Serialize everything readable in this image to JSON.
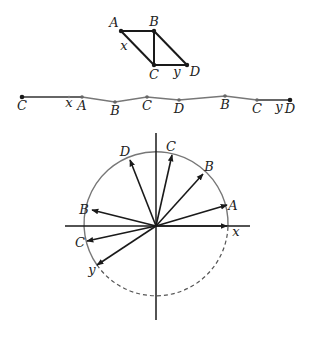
{
  "parallelogram": {
    "points": {
      "A": {
        "x": 121,
        "y": 31,
        "lx": 114,
        "ly": 27
      },
      "B": {
        "x": 154,
        "y": 31,
        "lx": 154,
        "ly": 26
      },
      "C": {
        "x": 154,
        "y": 65,
        "lx": 154,
        "ly": 79
      },
      "D": {
        "x": 187,
        "y": 65,
        "lx": 195,
        "ly": 76
      }
    },
    "labels": {
      "A": "A",
      "B": "B",
      "C": "C",
      "D": "D",
      "x": "x",
      "y": "y"
    },
    "x_label_pos": {
      "x": 124,
      "y": 50
    },
    "y_label_pos": {
      "x": 177,
      "y": 76
    }
  },
  "chain": {
    "points": [
      {
        "id": "C",
        "label": "C",
        "x": 22,
        "y": 97
      },
      {
        "id": "A",
        "label": "A",
        "x": 82,
        "y": 97
      },
      {
        "id": "B",
        "label": "B",
        "x": 115,
        "y": 102
      },
      {
        "id": "C2",
        "label": "C",
        "x": 147,
        "y": 97
      },
      {
        "id": "D",
        "label": "D",
        "x": 179,
        "y": 100
      },
      {
        "id": "B2",
        "label": "B",
        "x": 225,
        "y": 96
      },
      {
        "id": "C3",
        "label": "C",
        "x": 257,
        "y": 100
      },
      {
        "id": "D2",
        "label": "D",
        "x": 290,
        "y": 100
      }
    ],
    "x_label": "x",
    "y_label": "y",
    "x_label_pos": {
      "x": 69,
      "y": 107
    },
    "y_label_pos": {
      "x": 279,
      "y": 111
    }
  },
  "circle_diagram": {
    "center": {
      "x": 156,
      "y": 226
    },
    "radius": 72,
    "axis_color": "#1a1a1a",
    "circle_color": "#777777",
    "vectors": [
      {
        "label": "A",
        "tx": 227,
        "ty": 205,
        "lx": 233,
        "ly": 210
      },
      {
        "label": "B",
        "tx": 203,
        "ty": 174,
        "lx": 209,
        "ly": 171
      },
      {
        "label": "C",
        "tx": 172,
        "ty": 155,
        "lx": 171,
        "ly": 151
      },
      {
        "label": "D",
        "tx": 130,
        "ty": 160,
        "lx": 125,
        "ly": 156
      },
      {
        "label": "B",
        "tx": 92,
        "ty": 210,
        "lx": 84,
        "ly": 214
      },
      {
        "label": "C",
        "tx": 87,
        "ty": 241,
        "lx": 80,
        "ly": 247
      },
      {
        "label": "y",
        "tx": 97,
        "ty": 265,
        "lx": 92,
        "ly": 274
      },
      {
        "label": "x",
        "tx": 227,
        "ty": 226,
        "lx": 236,
        "ly": 236
      }
    ]
  }
}
